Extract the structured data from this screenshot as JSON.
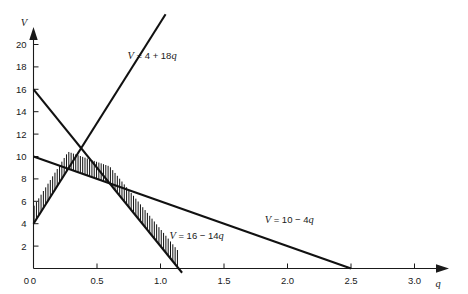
{
  "chart_data": {
    "type": "line",
    "title": "",
    "xlabel": "q",
    "ylabel": "V",
    "xlim": [
      0,
      3.25
    ],
    "ylim": [
      0,
      21.8
    ],
    "grid": false,
    "legend_position": "inline-annotations",
    "x_ticks": [
      "0",
      "0.5",
      "1.0",
      "1.5",
      "2.0",
      "2.5",
      "3.0"
    ],
    "x_tick_values": [
      0,
      0.5,
      1.0,
      1.5,
      2.0,
      2.5,
      3.0
    ],
    "y_ticks": [
      "2",
      "4",
      "6",
      "8",
      "10",
      "12",
      "14",
      "16",
      "18",
      "20"
    ],
    "y_tick_values": [
      2,
      4,
      6,
      8,
      10,
      12,
      14,
      16,
      18,
      20
    ],
    "axis_arrows": true,
    "series": [
      {
        "name": "V = 4 + 18q",
        "label": "V = 4 + 18q",
        "intercept": 4,
        "slope": 18,
        "x": [
          0,
          1.04
        ],
        "values": [
          4,
          22.7
        ],
        "label_x": 0.74,
        "label_y": 18.7
      },
      {
        "name": "V = 16 - 14q",
        "label": "V = 16 − 14q",
        "intercept": 16,
        "slope": -14,
        "x": [
          0,
          1.17
        ],
        "values": [
          16,
          -0.38
        ],
        "label_x": 1.07,
        "label_y": 2.6
      },
      {
        "name": "V = 10 - 4q",
        "label": "V = 10 − 4q",
        "intercept": 10,
        "slope": -4,
        "x": [
          0,
          2.5
        ],
        "values": [
          10,
          0
        ],
        "label_x": 1.82,
        "label_y": 4.1
      }
    ],
    "shaded_region": {
      "description": "hatched along lower envelope (minimum of the three lines)",
      "style": "vertical-hatch-above-boundary",
      "breakpoints": [
        {
          "q": 0,
          "V": 4
        },
        {
          "q": 0.2857,
          "V": 9.14
        },
        {
          "q": 0.6,
          "V": 7.6
        },
        {
          "q": 1.1429,
          "V": 0
        }
      ]
    },
    "annotations": [
      {
        "text": "V = 4 + 18q"
      },
      {
        "text": "V = 16 − 14q"
      },
      {
        "text": "V = 10 − 4q"
      }
    ],
    "colors": {
      "line": "#111111",
      "axis": "#1a1a1a",
      "background": "#ffffff"
    }
  }
}
